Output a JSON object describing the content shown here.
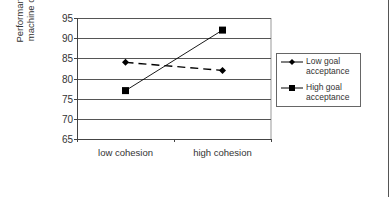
{
  "chart_data": {
    "type": "line",
    "title": "",
    "xlabel": "",
    "ylabel": "Performance (% of machine capacity)",
    "ylabel_lines": [
      "Performance (% of",
      "machine capacity)"
    ],
    "categories": [
      "low cohesion",
      "high cohesion"
    ],
    "series": [
      {
        "name": "Low goal acceptance",
        "legend_lines": [
          "Low goal",
          "acceptance"
        ],
        "values": [
          84,
          82
        ],
        "marker": "diamond",
        "line_style": "dashed",
        "color": "#000000"
      },
      {
        "name": "High goal acceptance",
        "legend_lines": [
          "High goal",
          "acceptance"
        ],
        "values": [
          77,
          92
        ],
        "marker": "square",
        "line_style": "solid",
        "color": "#000000"
      }
    ],
    "ylim": [
      65,
      95
    ],
    "yticks": [
      65,
      70,
      75,
      80,
      85,
      90,
      95
    ],
    "grid": true,
    "legend_position": "right"
  }
}
